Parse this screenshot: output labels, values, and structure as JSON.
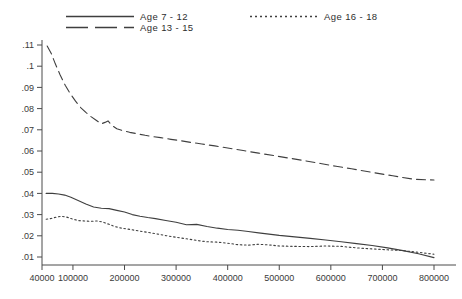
{
  "chart_data": {
    "type": "line",
    "title": "",
    "subtitle": "",
    "xlabel": "",
    "ylabel": "",
    "xlim": [
      40000,
      800000
    ],
    "ylim": [
      0.0,
      0.115
    ],
    "grid": false,
    "legend_position": "top",
    "x_ticks": [
      40000,
      100000,
      200000,
      300000,
      400000,
      500000,
      600000,
      700000,
      800000
    ],
    "x_tick_labels": [
      "40000",
      "100000",
      "200000",
      "300000",
      "400000",
      "500000",
      "600000",
      "700000",
      "800000"
    ],
    "y_ticks": [
      0.01,
      0.02,
      0.03,
      0.04,
      0.05,
      0.06,
      0.07,
      0.08,
      0.09,
      0.1,
      0.11
    ],
    "y_tick_labels": [
      ".01",
      ".02",
      ".03",
      ".04",
      ".05",
      ".06",
      ".07",
      ".08",
      ".09",
      ".1",
      ".11"
    ],
    "series": [
      {
        "name": "Age 7 - 12",
        "style": "solid",
        "color": "#3f3f3f",
        "x": [
          48000,
          60000,
          72000,
          84000,
          96000,
          110000,
          125000,
          140000,
          155000,
          170000,
          185000,
          200000,
          215000,
          230000,
          245000,
          260000,
          280000,
          300000,
          320000,
          340000,
          360000,
          380000,
          400000,
          420000,
          440000,
          460000,
          480000,
          500000,
          530000,
          560000,
          590000,
          620000,
          650000,
          680000,
          710000,
          740000,
          770000,
          800000
        ],
        "y": [
          0.04,
          0.04,
          0.0397,
          0.0392,
          0.0382,
          0.0367,
          0.035,
          0.0336,
          0.033,
          0.0328,
          0.032,
          0.0312,
          0.03,
          0.0292,
          0.0286,
          0.0281,
          0.0272,
          0.0264,
          0.0252,
          0.0254,
          0.0244,
          0.0236,
          0.023,
          0.0226,
          0.022,
          0.0214,
          0.0208,
          0.0202,
          0.0195,
          0.0188,
          0.018,
          0.0172,
          0.0163,
          0.0154,
          0.0143,
          0.013,
          0.0115,
          0.0097
        ]
      },
      {
        "name": "Age 13 - 15",
        "style": "dashed",
        "color": "#3f3f3f",
        "x": [
          50000,
          58000,
          66000,
          75000,
          85000,
          95000,
          105000,
          115000,
          125000,
          135000,
          145000,
          155000,
          162000,
          168000,
          175000,
          185000,
          195000,
          210000,
          225000,
          240000,
          255000,
          270000,
          290000,
          310000,
          330000,
          350000,
          375000,
          400000,
          430000,
          460000,
          490000,
          520000,
          550000,
          580000,
          610000,
          640000,
          680000,
          720000,
          760000,
          800000
        ],
        "y": [
          0.1095,
          0.106,
          0.101,
          0.096,
          0.091,
          0.087,
          0.0835,
          0.0805,
          0.0782,
          0.0762,
          0.0745,
          0.0728,
          0.0735,
          0.0742,
          0.0722,
          0.0705,
          0.0697,
          0.0688,
          0.0681,
          0.0674,
          0.0668,
          0.0663,
          0.0655,
          0.0648,
          0.064,
          0.0633,
          0.0624,
          0.0614,
          0.0602,
          0.059,
          0.0578,
          0.0566,
          0.0554,
          0.0541,
          0.0528,
          0.0516,
          0.0499,
          0.0483,
          0.0467,
          0.0463
        ]
      },
      {
        "name": "Age 16 - 18",
        "style": "dotted",
        "color": "#3f3f3f",
        "x": [
          48000,
          58000,
          68000,
          78000,
          88000,
          98000,
          110000,
          122000,
          134000,
          146000,
          158000,
          170000,
          182000,
          194000,
          206000,
          220000,
          235000,
          250000,
          265000,
          280000,
          300000,
          320000,
          340000,
          360000,
          380000,
          400000,
          420000,
          440000,
          460000,
          480000,
          500000,
          530000,
          560000,
          590000,
          620000,
          650000,
          680000,
          710000,
          740000,
          770000,
          800000
        ],
        "y": [
          0.0278,
          0.0282,
          0.0288,
          0.0292,
          0.0288,
          0.028,
          0.0272,
          0.027,
          0.0268,
          0.027,
          0.0265,
          0.0254,
          0.0243,
          0.0236,
          0.0232,
          0.0226,
          0.022,
          0.0214,
          0.0208,
          0.0201,
          0.0193,
          0.0186,
          0.0178,
          0.0172,
          0.017,
          0.0165,
          0.0158,
          0.0156,
          0.016,
          0.0157,
          0.0152,
          0.015,
          0.0149,
          0.0152,
          0.015,
          0.0143,
          0.0138,
          0.0134,
          0.013,
          0.0122,
          0.0113
        ]
      }
    ]
  },
  "legend": {
    "items": [
      {
        "label": "Age  7 - 12",
        "style": "solid"
      },
      {
        "label": "Age  13 - 15",
        "style": "dashed"
      },
      {
        "label": "Age  16 - 18",
        "style": "dotted"
      }
    ]
  }
}
